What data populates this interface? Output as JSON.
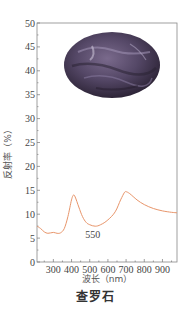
{
  "chart_data": {
    "type": "line",
    "title": "查罗石",
    "xlabel": "波长（nm）",
    "ylabel": "反射率（%）",
    "xlim": [
      210,
      980
    ],
    "ylim": [
      0,
      50
    ],
    "x_ticks": [
      300,
      400,
      500,
      600,
      700,
      800,
      900
    ],
    "y_ticks": [
      0,
      5,
      10,
      15,
      20,
      25,
      30,
      35,
      40,
      45,
      50
    ],
    "grid": false,
    "legend": null,
    "annotations": [
      {
        "text": "550",
        "x": 550,
        "y": 5.5
      }
    ],
    "inset_image": "photo of a rounded purple charoite cabochon with dark streaks, upper part of plot",
    "series": [
      {
        "name": "查罗石",
        "color": "#e8956a",
        "x": [
          210,
          230,
          250,
          270,
          300,
          320,
          340,
          360,
          380,
          400,
          410,
          420,
          440,
          460,
          480,
          500,
          530,
          560,
          600,
          640,
          670,
          690,
          700,
          720,
          760,
          800,
          850,
          900,
          950,
          980
        ],
        "y": [
          7.5,
          7.0,
          6.3,
          6.0,
          6.2,
          6.0,
          6.1,
          7.0,
          9.5,
          13.0,
          14.0,
          13.6,
          11.5,
          9.5,
          8.3,
          7.8,
          7.5,
          7.8,
          8.8,
          10.5,
          13.0,
          14.5,
          14.7,
          14.3,
          13.0,
          12.0,
          11.2,
          10.7,
          10.4,
          10.3
        ]
      }
    ]
  },
  "labels": {
    "caption": "查罗石",
    "xlabel": "波长（nm）",
    "ylabel": "反射率（%）",
    "annotation": "550"
  },
  "colors": {
    "curve": "#e8956a",
    "axis": "#777777"
  }
}
